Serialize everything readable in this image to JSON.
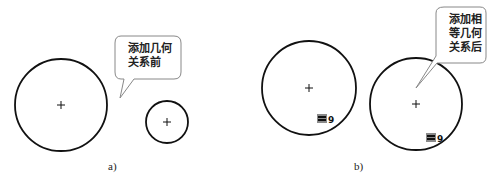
{
  "panel_a": {
    "label": "a)",
    "callout": {
      "line1": "添加几何",
      "line2": "关系前"
    },
    "circles": [
      {
        "name": "large-circle",
        "cx": 61,
        "cy": 105,
        "r": 46
      },
      {
        "name": "small-circle",
        "cx": 167,
        "cy": 122,
        "r": 21
      }
    ]
  },
  "panel_b": {
    "label": "b)",
    "callout": {
      "line1": "添加相",
      "line2": "等几何",
      "line3": "关系后"
    },
    "circles": [
      {
        "name": "left-circle",
        "cx": 309,
        "cy": 88,
        "r": 47
      },
      {
        "name": "right-circle",
        "cx": 416,
        "cy": 104,
        "r": 46
      }
    ],
    "equal_relation": {
      "symbol": "=",
      "index": "9"
    }
  },
  "colors": {
    "stroke": "#111111",
    "callout_border": "#888888",
    "badge": "#8a8a8a"
  }
}
